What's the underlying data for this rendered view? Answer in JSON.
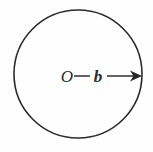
{
  "figure": {
    "kind": "geometry-diagram",
    "background_color": "#fefefe",
    "ink_color": "#2b2b2b",
    "width": 153,
    "height": 152
  },
  "circle": {
    "name": "circle-outline",
    "center_x": 78,
    "center_y": 74,
    "radius": 64,
    "stroke_color": "#2b2b2b",
    "stroke_width": 1.6,
    "fill": "none"
  },
  "labels": {
    "center_point": {
      "text": "O",
      "x": 67,
      "y": 82,
      "style": "italic"
    },
    "radius": {
      "text": "b",
      "x": 98,
      "y": 82,
      "style": "bold-italic"
    }
  },
  "radius_arrow": {
    "name": "radius-arrow",
    "y": 76,
    "segments": [
      {
        "x1": 74,
        "x2": 90
      },
      {
        "x1": 107,
        "x2": 136
      }
    ],
    "arrow_head": {
      "tip_x": 142,
      "length": 12,
      "half_height": 5.5,
      "notch": 3.5,
      "color": "#262626"
    },
    "stroke_color": "#2f2f2f",
    "stroke_width": 1.5
  }
}
